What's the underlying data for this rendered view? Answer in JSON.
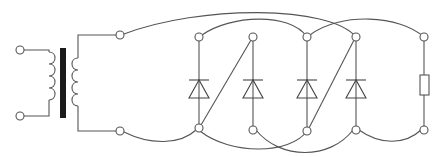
{
  "diagram": {
    "type": "circuit-schematic",
    "colors": {
      "wire": "#555555",
      "core": "#1a1a1a",
      "background": "#ffffff"
    },
    "components": [
      {
        "id": "input-terminal-top",
        "kind": "terminal"
      },
      {
        "id": "input-terminal-bottom",
        "kind": "terminal"
      },
      {
        "id": "transformer",
        "kind": "transformer",
        "primary_turns": 4,
        "secondary_turns": 4,
        "core": "iron"
      },
      {
        "id": "secondary-terminal-top",
        "kind": "terminal"
      },
      {
        "id": "secondary-terminal-bottom",
        "kind": "terminal"
      },
      {
        "id": "diode-1",
        "kind": "diode",
        "orientation": "anode-bottom"
      },
      {
        "id": "diode-2",
        "kind": "diode",
        "orientation": "anode-bottom"
      },
      {
        "id": "diode-3",
        "kind": "diode",
        "orientation": "anode-bottom"
      },
      {
        "id": "diode-4",
        "kind": "diode",
        "orientation": "anode-bottom"
      },
      {
        "id": "load-resistor",
        "kind": "resistor"
      }
    ],
    "node_count": 14
  }
}
